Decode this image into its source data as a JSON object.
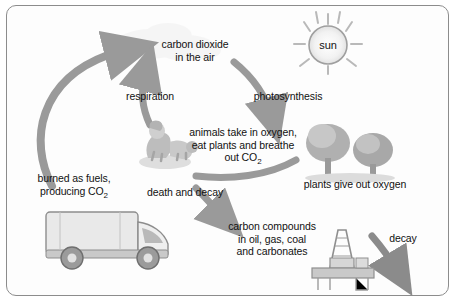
{
  "diagram": {
    "labels": {
      "carbon_dioxide": "carbon dioxide\nin the air",
      "sun": "sun",
      "respiration": "respiration",
      "photosynthesis": "photosynthesis",
      "animals": "animals take in oxygen,\neat plants and breathe\nout CO",
      "animals_sub": "2",
      "plants_oxygen": "plants give out oxygen",
      "burned": "burned as fuels,\nproducing CO",
      "burned_sub": "2",
      "death_decay": "death and decay",
      "carbon_compounds": "carbon compounds\nin oil, gas, coal\nand carbonates",
      "decay": "decay"
    },
    "icons": {
      "sun": "sun-icon",
      "animal": "animal-icon",
      "trees": "trees-icon",
      "truck": "truck-icon",
      "oil-rig": "oil-rig-icon",
      "cloud": "cloud-icon"
    },
    "colors": {
      "arrow": "#9a9a9a",
      "arrow_dark": "#7d7d7d",
      "frame": "#8c8c8c",
      "text": "#111111",
      "fill_light": "#d7d7d7",
      "fill_mid": "#b8b8b8",
      "fill_dark": "#8f8f8f"
    }
  }
}
